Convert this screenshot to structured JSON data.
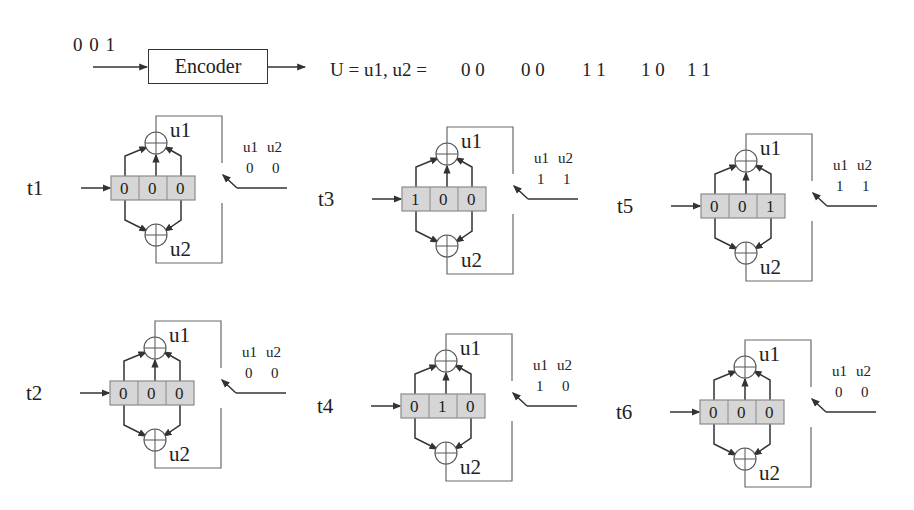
{
  "header": {
    "input_bits": "0  0  1",
    "encoder_label": "Encoder",
    "output_expression": "U = u1, u2 =",
    "output_pairs": [
      "0 0",
      "0 0",
      "1 1",
      "1 0",
      "1 1"
    ]
  },
  "labels": {
    "adder_top": "u1",
    "adder_bottom": "u2",
    "out_col1": "u1",
    "out_col2": "u2"
  },
  "colors": {
    "line": "#333333",
    "register_fill": "#d6d6d6",
    "register_border": "#8a8a8a",
    "bracket": "#6a6a6a"
  },
  "panels": [
    {
      "id": "t1",
      "label": "t1",
      "register": [
        "0",
        "0",
        "0"
      ],
      "u1": "0",
      "u2": "0",
      "x": 111,
      "y": 176
    },
    {
      "id": "t3",
      "label": "t3",
      "register": [
        "1",
        "0",
        "0"
      ],
      "u1": "1",
      "u2": "1",
      "x": 402,
      "y": 187
    },
    {
      "id": "t5",
      "label": "t5",
      "register": [
        "0",
        "0",
        "1"
      ],
      "u1": "1",
      "u2": "1",
      "x": 701,
      "y": 194
    },
    {
      "id": "t2",
      "label": "t2",
      "register": [
        "0",
        "0",
        "0"
      ],
      "u1": "0",
      "u2": "0",
      "x": 110,
      "y": 381
    },
    {
      "id": "t4",
      "label": "t4",
      "register": [
        "0",
        "1",
        "0"
      ],
      "u1": "1",
      "u2": "0",
      "x": 401,
      "y": 394
    },
    {
      "id": "t6",
      "label": "t6",
      "register": [
        "0",
        "0",
        "0"
      ],
      "u1": "0",
      "u2": "0",
      "x": 700,
      "y": 400
    }
  ]
}
